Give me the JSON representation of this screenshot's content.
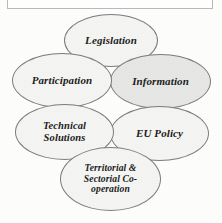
{
  "caption_box": {
    "present": true,
    "text": ""
  },
  "diagram": {
    "type": "ellipse-cluster",
    "shape_count": 6,
    "default_fill": "#f4f4f2",
    "highlight_fill": "#e6e6e4",
    "outline_color": "#7c7c7c",
    "text_color": "#1c1c1c",
    "nodes": [
      {
        "id": "legislation",
        "label": "Legislation",
        "lines": [
          "Legislation"
        ],
        "position": "top-center",
        "highlighted": false
      },
      {
        "id": "participation",
        "label": "Participation",
        "lines": [
          "Participation"
        ],
        "position": "upper-left",
        "highlighted": false
      },
      {
        "id": "information",
        "label": "Information",
        "lines": [
          "Information"
        ],
        "position": "upper-right",
        "highlighted": true
      },
      {
        "id": "technical-solutions",
        "label": "Technical Solutions",
        "lines": [
          "Technical",
          "Solutions"
        ],
        "position": "lower-left",
        "highlighted": false
      },
      {
        "id": "eu-policy",
        "label": "EU Policy",
        "lines": [
          "EU Policy"
        ],
        "position": "lower-right",
        "highlighted": false
      },
      {
        "id": "territorial-sectorial-cooperation",
        "label": "Territorial & Sectorial Co-operation",
        "lines": [
          "Territorial &",
          "Sectorial Co-",
          "operation"
        ],
        "position": "bottom-center",
        "highlighted": false
      }
    ]
  }
}
